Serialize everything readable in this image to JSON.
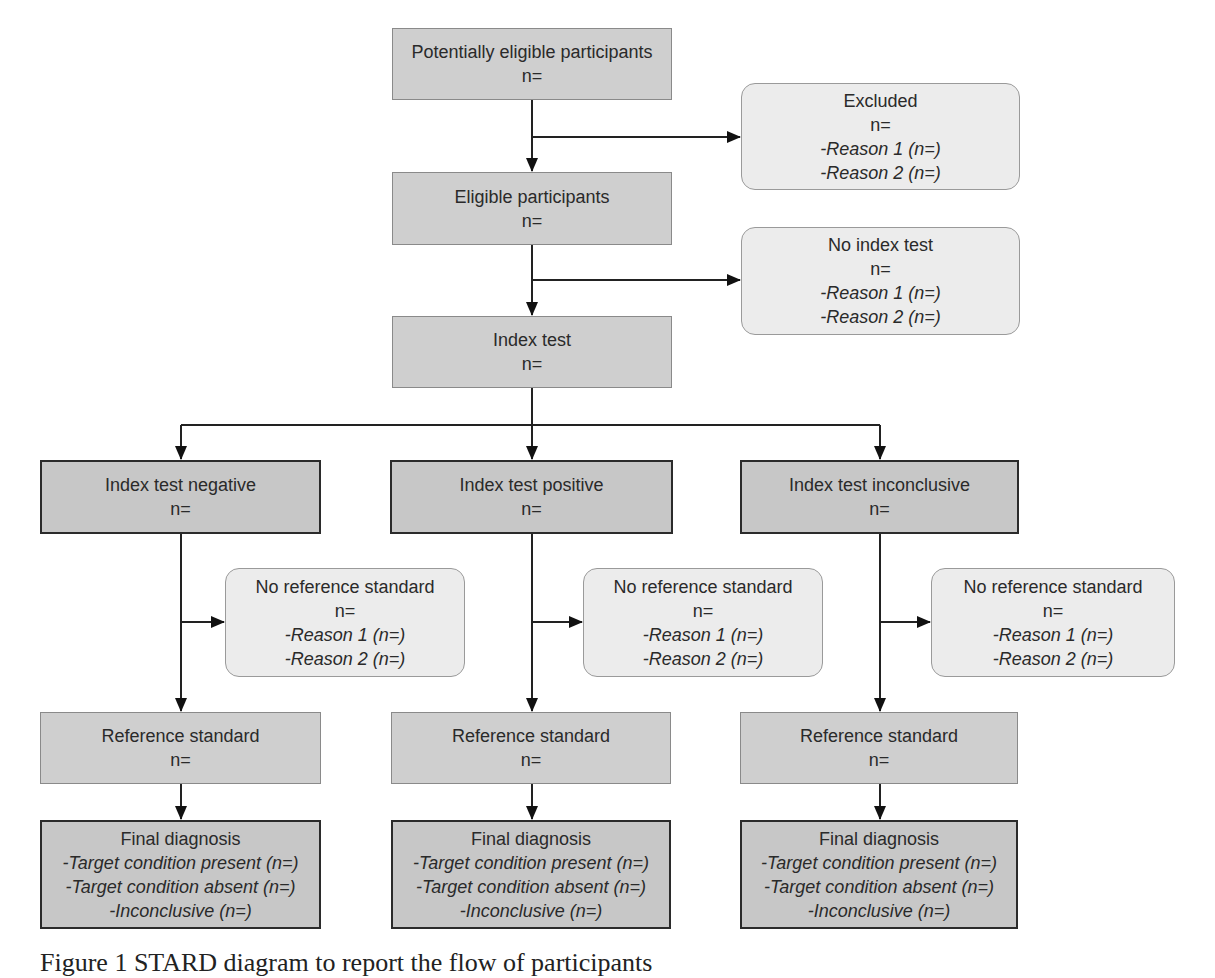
{
  "diagram": {
    "top_column": {
      "potentially_eligible": {
        "title": "Potentially eligible participants",
        "n": "n="
      },
      "eligible": {
        "title": "Eligible participants",
        "n": "n="
      },
      "index_test": {
        "title": "Index test",
        "n": "n="
      }
    },
    "side_exclusions": {
      "excluded": {
        "title": "Excluded",
        "n": "n=",
        "reason1": "-Reason 1 (n=)",
        "reason2": "-Reason 2 (n=)"
      },
      "no_index_test": {
        "title": "No index test",
        "n": "n=",
        "reason1": "-Reason 1 (n=)",
        "reason2": "-Reason 2 (n=)"
      }
    },
    "branches": [
      {
        "result": {
          "title": "Index test negative",
          "n": "n="
        },
        "no_reference": {
          "title": "No reference standard",
          "n": "n=",
          "reason1": "-Reason 1 (n=)",
          "reason2": "-Reason 2 (n=)"
        },
        "reference": {
          "title": "Reference standard",
          "n": "n="
        },
        "final": {
          "title": "Final diagnosis",
          "present": "-Target condition present (n=)",
          "absent": "-Target condition absent (n=)",
          "inconclusive": "-Inconclusive (n=)"
        }
      },
      {
        "result": {
          "title": "Index test positive",
          "n": "n="
        },
        "no_reference": {
          "title": "No reference standard",
          "n": "n=",
          "reason1": "-Reason 1 (n=)",
          "reason2": "-Reason 2 (n=)"
        },
        "reference": {
          "title": "Reference standard",
          "n": "n="
        },
        "final": {
          "title": "Final diagnosis",
          "present": "-Target condition present (n=)",
          "absent": "-Target condition absent (n=)",
          "inconclusive": "-Inconclusive (n=)"
        }
      },
      {
        "result": {
          "title": "Index test inconclusive",
          "n": "n="
        },
        "no_reference": {
          "title": "No reference standard",
          "n": "n=",
          "reason1": "-Reason 1 (n=)",
          "reason2": "-Reason 2 (n=)"
        },
        "reference": {
          "title": "Reference standard",
          "n": "n="
        },
        "final": {
          "title": "Final diagnosis",
          "present": "-Target condition present (n=)",
          "absent": "-Target condition absent (n=)",
          "inconclusive": "-Inconclusive (n=)"
        }
      }
    ]
  },
  "caption": "Figure 1 STARD diagram to report the flow of participants"
}
